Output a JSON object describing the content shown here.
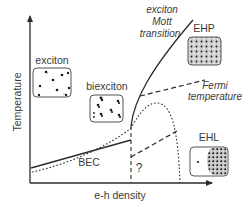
{
  "diagram": {
    "title": "",
    "axes": {
      "y_label": "Temperature",
      "x_label": "e-h density"
    },
    "phases": {
      "exciton": "exciton",
      "biexciton": "biexciton",
      "ehp": "EHP",
      "ehl": "EHL",
      "bec": "BEC"
    },
    "annotations": {
      "mott_line1": "exciton",
      "mott_line2": "Mott",
      "mott_line3": "transition",
      "fermi_line1": "Fermi",
      "fermi_line2": "temperature",
      "unknown": "?"
    },
    "colors": {
      "line": "#2b2b2b",
      "text": "#3a3a3a",
      "box_border": "#555555",
      "dot": "#1a1a1a",
      "shade": "#c8c8c8"
    }
  }
}
